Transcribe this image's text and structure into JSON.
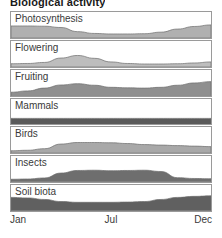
{
  "title": "Biological activity",
  "axis": {
    "ticks": [
      {
        "label": "Jan",
        "pos": 0
      },
      {
        "label": "Jul",
        "pos": 50
      },
      {
        "label": "Dec",
        "pos": 100
      }
    ]
  },
  "colors": {
    "panel_border": "#9a9a9a",
    "panel_background": "#ffffff",
    "label_text": "#3a3a3a",
    "title_text": "#1a1a1a"
  },
  "chart_data": {
    "type": "area",
    "title": "Biological activity",
    "xlabel": "",
    "ylabel": "",
    "xlim": [
      0,
      100
    ],
    "ylim": [
      0,
      100
    ],
    "grid": false,
    "legend": "none",
    "layout": "stacked small-multiples, 7 panels sharing one x-axis",
    "x_tick_labels": [
      "Jan",
      "Jul",
      "Dec"
    ],
    "x": [
      0,
      8.3,
      16.7,
      25,
      33.3,
      41.7,
      50,
      58.3,
      66.7,
      75,
      83.3,
      91.7,
      100
    ],
    "series": [
      {
        "name": "Photosynthesis",
        "fill": "#b0b0b0",
        "values": [
          46,
          46,
          45,
          40,
          24,
          17,
          15,
          15,
          16,
          22,
          34,
          44,
          50
        ]
      },
      {
        "name": "Flowering",
        "fill": "#bdbdbd",
        "values": [
          12,
          13,
          17,
          34,
          44,
          33,
          19,
          13,
          11,
          11,
          12,
          15,
          19
        ]
      },
      {
        "name": "Fruiting",
        "fill": "#8f8f8f",
        "values": [
          14,
          19,
          30,
          42,
          47,
          41,
          33,
          31,
          30,
          33,
          41,
          50,
          55
        ]
      },
      {
        "name": "Mammals",
        "fill": "#5a5a5a",
        "values": [
          25,
          25,
          25,
          25,
          25,
          25,
          25,
          25,
          25,
          25,
          25,
          25,
          25
        ]
      },
      {
        "name": "Birds",
        "fill": "#a8a8a8",
        "values": [
          8,
          10,
          16,
          34,
          40,
          40,
          39,
          36,
          32,
          30,
          28,
          26,
          24
        ]
      },
      {
        "name": "Insects",
        "fill": "#6e6e6e",
        "values": [
          10,
          11,
          15,
          34,
          44,
          45,
          43,
          44,
          45,
          40,
          16,
          13,
          12
        ]
      },
      {
        "name": "Soil biota",
        "fill": "#606060",
        "values": [
          52,
          50,
          44,
          36,
          33,
          33,
          33,
          34,
          36,
          44,
          52,
          56,
          58
        ]
      }
    ]
  }
}
